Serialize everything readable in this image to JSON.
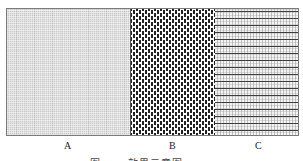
{
  "figure": {
    "panels": [
      {
        "label": "A",
        "pattern": "fine-grid"
      },
      {
        "label": "B",
        "pattern": "staggered-dots"
      },
      {
        "label": "C",
        "pattern": "horizontal-lines"
      }
    ],
    "caption": "图  ·  ·  ·  效果示意图"
  }
}
